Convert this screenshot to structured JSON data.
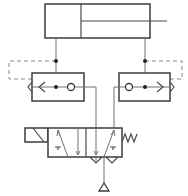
{
  "diagram": {
    "type": "pneumatic-circuit",
    "components": [
      {
        "id": "cylinder",
        "label": "double-acting cylinder"
      },
      {
        "id": "left-quick-exhaust",
        "label": "quick exhaust valve (left)"
      },
      {
        "id": "right-quick-exhaust",
        "label": "quick exhaust valve (right)"
      },
      {
        "id": "directional-valve",
        "label": "5/2 solenoid valve, spring return"
      },
      {
        "id": "supply",
        "label": "pressure source"
      }
    ],
    "colors": {
      "line": "#4a4a4a",
      "pilot": "#8a8a8a",
      "background": "#ffffff"
    }
  }
}
